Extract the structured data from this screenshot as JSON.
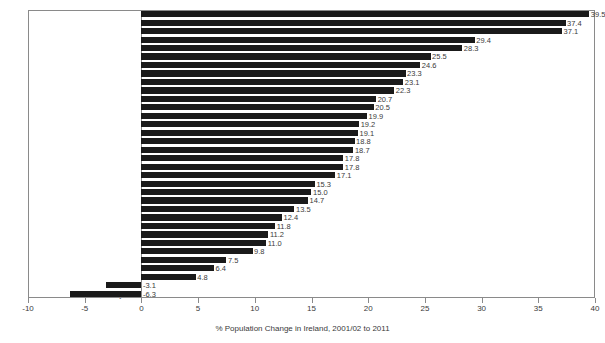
{
  "chart_data": {
    "type": "bar",
    "orientation": "horizontal",
    "title": "",
    "xlabel": "% Population Change in Ireland, 2001/02 to 2011",
    "ylabel": "",
    "xlim": [
      -10,
      40
    ],
    "xticks": [
      -10,
      -5,
      0,
      5,
      10,
      15,
      20,
      25,
      30,
      35,
      40
    ],
    "xtick_labels": [
      "-10",
      "-5",
      "0",
      "5",
      "10",
      "15",
      "20",
      "25",
      "30",
      "35",
      "40"
    ],
    "grid": false,
    "legend": false,
    "bar_color": "#1a1a1a",
    "categories": [
      "Fingal",
      "Meath",
      "Laoighis",
      "Cavan",
      "Kildare",
      "Longford",
      "Wexford",
      "Leitrim",
      "Cork Co",
      "Galway Co",
      "Louth",
      "Offaly",
      "Westmeath",
      "Wicklow",
      "Roscommon",
      "Kilkenny",
      "Carlow",
      "Limerick Co",
      "Waterford Co",
      "Donegal",
      "Tipperary N",
      "Monaghan",
      "Galway City",
      "Clare",
      "Sligo",
      "Tipperary S",
      "Mayo",
      "South Dublin",
      "Kerry",
      "DLR",
      "Dublin City",
      "Waterford City",
      "Cork City",
      "Limerick City"
    ],
    "values": [
      39.5,
      37.4,
      37.1,
      29.4,
      28.3,
      25.5,
      24.6,
      23.3,
      23.1,
      22.3,
      20.7,
      20.5,
      19.9,
      19.2,
      19.1,
      18.8,
      18.7,
      17.8,
      17.8,
      17.1,
      15.3,
      15.0,
      14.7,
      13.5,
      12.4,
      11.8,
      11.2,
      11.0,
      9.8,
      7.5,
      6.4,
      4.8,
      -3.1,
      -6.3
    ],
    "value_labels": [
      "39.5",
      "37.4",
      "37.1",
      "29.4",
      "28.3",
      "25.5",
      "24.6",
      "23.3",
      "23.1",
      "22.3",
      "20.7",
      "20.5",
      "19.9",
      "19.2",
      "19.1",
      "18.8",
      "18.7",
      "17.8",
      "17.8",
      "17.1",
      "15.3",
      "15.0",
      "14.7",
      "13.5",
      "12.4",
      "11.8",
      "11.2",
      "11.0",
      "9.8",
      "7.5",
      "6.4",
      "4.8",
      "-3.1",
      "-6.3"
    ]
  }
}
